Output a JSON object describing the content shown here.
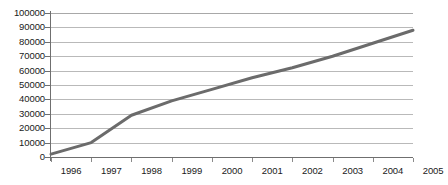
{
  "chart_data": {
    "type": "line",
    "title": "",
    "subtitle": "",
    "xlabel": "",
    "ylabel": "",
    "x": [
      1996,
      1997,
      1998,
      1999,
      2000,
      2001,
      2002,
      2003,
      2004,
      2005
    ],
    "categories": [
      "1996",
      "1997",
      "1998",
      "1999",
      "2000",
      "2001",
      "2002",
      "2003",
      "2004",
      "2005"
    ],
    "series": [
      {
        "name": "",
        "values": [
          2000,
          10000,
          29000,
          39000,
          47000,
          55000,
          62000,
          70000,
          79000,
          88000
        ]
      }
    ],
    "xlim": [
      1996,
      2005
    ],
    "ylim": [
      0,
      100000
    ],
    "ytick_labels": [
      "100000",
      "90000",
      "80000",
      "70000",
      "60000",
      "50000",
      "40000",
      "30000",
      "20000",
      "10000",
      "0"
    ],
    "ytick_values": [
      100000,
      90000,
      80000,
      70000,
      60000,
      50000,
      40000,
      30000,
      20000,
      10000,
      0
    ],
    "ytick_step": 10000,
    "grid": true,
    "grid_axis": "y",
    "legend": false,
    "legend_position": "none",
    "annotations": [],
    "colors": {
      "line": "#6b6b6b",
      "grid": "#b9b9b9",
      "axis": "#6f6f6f",
      "text": "#1a1a1a",
      "background": "#ffffff"
    },
    "line_width": 3,
    "markers": false
  }
}
